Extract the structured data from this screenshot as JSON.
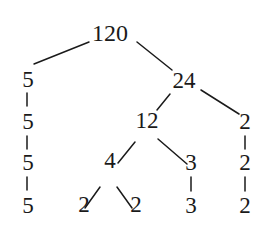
{
  "diagram": {
    "type": "factor-tree",
    "root": "120",
    "nodes": [
      {
        "id": "n120",
        "label": "120",
        "x": 110,
        "y": 33,
        "size": 24
      },
      {
        "id": "n5a",
        "label": "5",
        "x": 28,
        "y": 79,
        "size": 23
      },
      {
        "id": "n24",
        "label": "24",
        "x": 184,
        "y": 80,
        "size": 23
      },
      {
        "id": "n5b",
        "label": "5",
        "x": 28,
        "y": 121,
        "size": 23
      },
      {
        "id": "n12",
        "label": "12",
        "x": 147,
        "y": 120,
        "size": 23
      },
      {
        "id": "n2a",
        "label": "2",
        "x": 245,
        "y": 121,
        "size": 23
      },
      {
        "id": "n5c",
        "label": "5",
        "x": 28,
        "y": 162,
        "size": 23
      },
      {
        "id": "n4",
        "label": "4",
        "x": 110,
        "y": 160,
        "size": 23
      },
      {
        "id": "n3a",
        "label": "3",
        "x": 191,
        "y": 162,
        "size": 23
      },
      {
        "id": "n2b",
        "label": "2",
        "x": 245,
        "y": 162,
        "size": 23
      },
      {
        "id": "n5d",
        "label": "5",
        "x": 28,
        "y": 205,
        "size": 23
      },
      {
        "id": "n2c",
        "label": "2",
        "x": 84,
        "y": 204,
        "size": 23
      },
      {
        "id": "n2d",
        "label": "2",
        "x": 136,
        "y": 204,
        "size": 23
      },
      {
        "id": "n3b",
        "label": "3",
        "x": 191,
        "y": 205,
        "size": 23
      },
      {
        "id": "n2e",
        "label": "2",
        "x": 245,
        "y": 205,
        "size": 23
      }
    ],
    "edges": [
      {
        "from": "n120",
        "to": "n5a",
        "x1": 89,
        "y1": 42,
        "x2": 34,
        "y2": 64
      },
      {
        "from": "n120",
        "to": "n24",
        "x1": 137,
        "y1": 42,
        "x2": 172,
        "y2": 70
      },
      {
        "from": "n5a",
        "to": "n5b",
        "x1": 27,
        "y1": 93,
        "x2": 27,
        "y2": 106
      },
      {
        "from": "n24",
        "to": "n12",
        "x1": 170,
        "y1": 94,
        "x2": 157,
        "y2": 110
      },
      {
        "from": "n24",
        "to": "n2a",
        "x1": 201,
        "y1": 90,
        "x2": 239,
        "y2": 114
      },
      {
        "from": "n5b",
        "to": "n5c",
        "x1": 27,
        "y1": 136,
        "x2": 27,
        "y2": 149
      },
      {
        "from": "n12",
        "to": "n4",
        "x1": 135,
        "y1": 142,
        "x2": 118,
        "y2": 163
      },
      {
        "from": "n12",
        "to": "n3a",
        "x1": 158,
        "y1": 139,
        "x2": 187,
        "y2": 164
      },
      {
        "from": "n2a",
        "to": "n2b",
        "x1": 245,
        "y1": 136,
        "x2": 245,
        "y2": 149
      },
      {
        "from": "n5c",
        "to": "n5d",
        "x1": 27,
        "y1": 177,
        "x2": 27,
        "y2": 190
      },
      {
        "from": "n4",
        "to": "n2c",
        "x1": 100,
        "y1": 187,
        "x2": 85,
        "y2": 208
      },
      {
        "from": "n4",
        "to": "n2d",
        "x1": 117,
        "y1": 187,
        "x2": 132,
        "y2": 208
      },
      {
        "from": "n3a",
        "to": "n3b",
        "x1": 191,
        "y1": 177,
        "x2": 191,
        "y2": 191
      },
      {
        "from": "n2b",
        "to": "n2e",
        "x1": 245,
        "y1": 177,
        "x2": 245,
        "y2": 191
      }
    ],
    "leaves": [
      "5",
      "2",
      "2",
      "3",
      "2"
    ],
    "colors": {
      "ink": "#1a1a1a",
      "background": "#ffffff"
    }
  }
}
